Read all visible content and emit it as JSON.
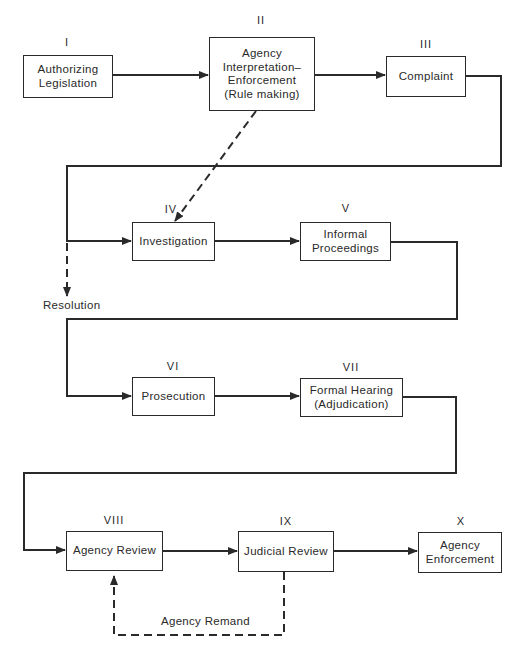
{
  "diagram": {
    "type": "flowchart",
    "nodes": [
      {
        "id": "I",
        "numeral": "I",
        "lines": [
          "Authorizing",
          "Legislation"
        ]
      },
      {
        "id": "II",
        "numeral": "II",
        "lines": [
          "Agency",
          "Interpretation–",
          "Enforcement",
          "(Rule making)"
        ]
      },
      {
        "id": "III",
        "numeral": "III",
        "lines": [
          "Complaint"
        ]
      },
      {
        "id": "IV",
        "numeral": "IV",
        "lines": [
          "Investigation"
        ]
      },
      {
        "id": "V",
        "numeral": "V",
        "lines": [
          "Informal",
          "Proceedings"
        ]
      },
      {
        "id": "VI",
        "numeral": "VI",
        "lines": [
          "Prosecution"
        ]
      },
      {
        "id": "VII",
        "numeral": "VII",
        "lines": [
          "Formal Hearing",
          "(Adjudication)"
        ]
      },
      {
        "id": "VIII",
        "numeral": "VIII",
        "lines": [
          "Agency Review"
        ]
      },
      {
        "id": "IX",
        "numeral": "IX",
        "lines": [
          "Judicial Review"
        ]
      },
      {
        "id": "X",
        "numeral": "X",
        "lines": [
          "Agency",
          "Enforcement"
        ]
      }
    ],
    "edges": [
      {
        "from": "I",
        "to": "II",
        "style": "solid"
      },
      {
        "from": "II",
        "to": "III",
        "style": "solid"
      },
      {
        "from": "II",
        "to": "IV",
        "style": "dashed"
      },
      {
        "from": "III",
        "to": "IV",
        "style": "solid"
      },
      {
        "from": "III",
        "to": "Resolution",
        "style": "dashed"
      },
      {
        "from": "IV",
        "to": "V",
        "style": "solid"
      },
      {
        "from": "V",
        "to": "VI",
        "style": "solid"
      },
      {
        "from": "VI",
        "to": "VII",
        "style": "solid"
      },
      {
        "from": "VII",
        "to": "VIII",
        "style": "solid"
      },
      {
        "from": "VIII",
        "to": "IX",
        "style": "solid"
      },
      {
        "from": "IX",
        "to": "X",
        "style": "solid"
      },
      {
        "from": "IX",
        "to": "VIII",
        "style": "dashed",
        "label": "Agency Remand"
      }
    ],
    "labels": {
      "resolution": "Resolution",
      "agency_remand": "Agency Remand"
    }
  }
}
